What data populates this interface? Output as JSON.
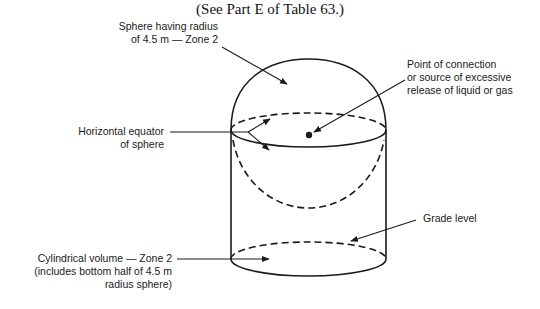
{
  "title": "(See Part E of Table 63.)",
  "labels": {
    "sphere": [
      "Sphere having radius",
      "of 4.5 m — Zone 2"
    ],
    "point": [
      "Point of connection",
      "or source of excessive",
      "release of liquid or gas"
    ],
    "equator": [
      "Horizontal equator",
      "of sphere"
    ],
    "grade": "Grade level",
    "cylinder": [
      "Cylindrical volume — Zone 2",
      "(includes bottom half of 4.5 m",
      "radius sphere)"
    ]
  },
  "colors": {
    "line": "#1a1a1a",
    "background": "#ffffff"
  }
}
